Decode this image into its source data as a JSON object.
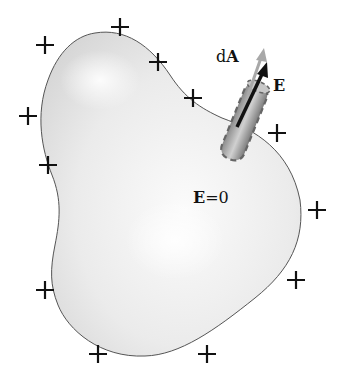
{
  "figure": {
    "labels": {
      "area_element": "dA",
      "area_element_prefix": "d",
      "area_element_bold": "A",
      "field_outside": "E",
      "field_inside": "E=0",
      "field_inside_bold": "E",
      "field_inside_rest": "=0"
    },
    "charge_symbol": "+",
    "charges": [
      {
        "x": 45,
        "y": 45
      },
      {
        "x": 120,
        "y": 27
      },
      {
        "x": 158,
        "y": 62
      },
      {
        "x": 193,
        "y": 98
      },
      {
        "x": 28,
        "y": 116
      },
      {
        "x": 48,
        "y": 165
      },
      {
        "x": 277,
        "y": 133
      },
      {
        "x": 317,
        "y": 210
      },
      {
        "x": 296,
        "y": 280
      },
      {
        "x": 45,
        "y": 290
      },
      {
        "x": 98,
        "y": 354
      },
      {
        "x": 207,
        "y": 354
      }
    ],
    "colors": {
      "conductor_fill": "#e6e6e6",
      "conductor_edge": "#555555",
      "pillbox": "#9a9a9a",
      "arrow_dA": "#a8a8a8",
      "arrow_E": "#111111"
    }
  }
}
